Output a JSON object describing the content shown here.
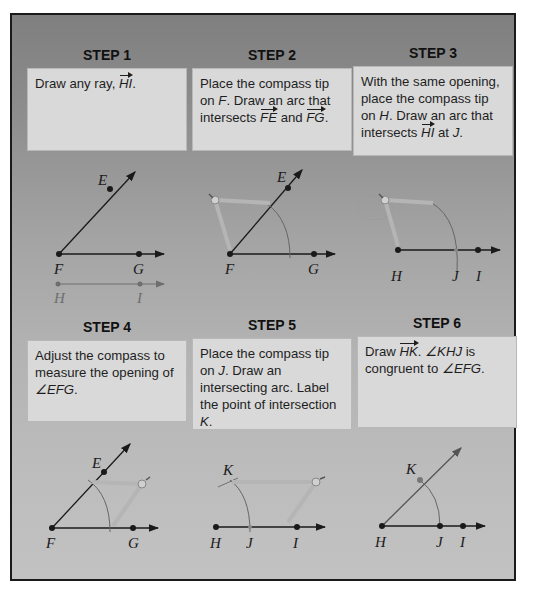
{
  "steps": [
    {
      "title": "STEP 1",
      "text_parts": [
        "Draw any ray, ",
        "HI",
        "."
      ],
      "figure": {
        "labels": [
          "E",
          "F",
          "G",
          "H",
          "I"
        ]
      }
    },
    {
      "title": "STEP 2",
      "text_parts": [
        "Place the compass tip on ",
        "F",
        ". Draw an arc that intersects ",
        "FE",
        " and ",
        "FG",
        "."
      ],
      "figure": {
        "labels": [
          "E",
          "F",
          "G"
        ]
      }
    },
    {
      "title": "STEP 3",
      "text_parts": [
        "With the same opening, place the compass tip on ",
        "H",
        ". Draw an arc that intersects ",
        "HI",
        " at ",
        "J",
        "."
      ],
      "figure": {
        "labels": [
          "H",
          "J",
          "I"
        ]
      }
    },
    {
      "title": "STEP 4",
      "text_parts": [
        "Adjust the compass to measure the opening of ",
        "∠EFG",
        "."
      ],
      "figure": {
        "labels": [
          "E",
          "F",
          "G"
        ]
      }
    },
    {
      "title": "STEP 5",
      "text_parts": [
        "Place the compass tip on ",
        "J",
        ". Draw an intersecting arc. Label the point of intersection ",
        "K",
        "."
      ],
      "figure": {
        "labels": [
          "K",
          "H",
          "J",
          "I"
        ]
      }
    },
    {
      "title": "STEP 6",
      "text_parts": [
        "Draw ",
        "HK",
        ". ",
        "∠KHJ",
        " is congruent to ",
        "∠EFG",
        "."
      ],
      "figure": {
        "labels": [
          "K",
          "H",
          "J",
          "I"
        ]
      }
    }
  ],
  "colors": {
    "frame_border": "#1a1a1a",
    "box_fill": "#d9d9d9",
    "ink": "#1a1a1a",
    "compass": "#b5b5b5",
    "ghost_ray": "#6e6e6e"
  }
}
